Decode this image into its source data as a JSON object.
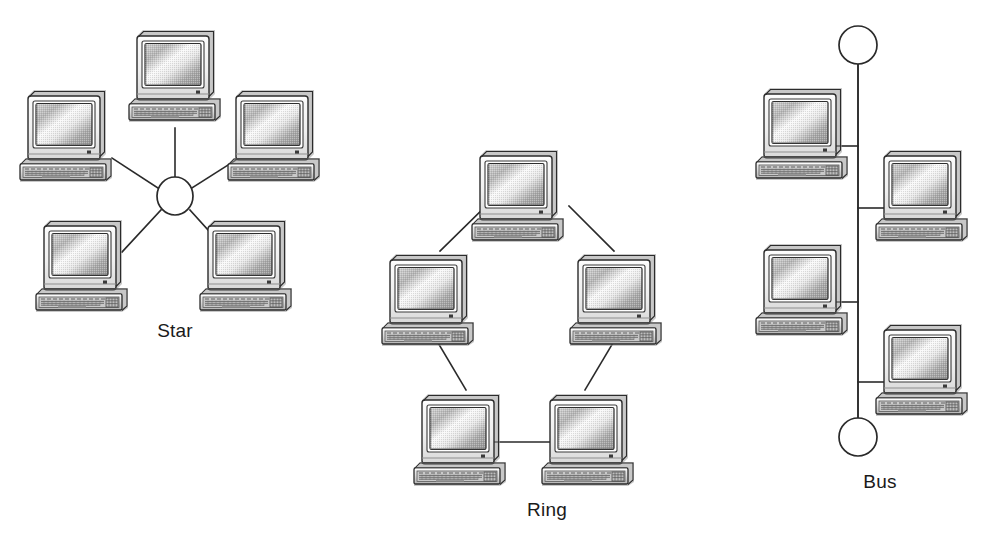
{
  "figure": {
    "background_color": "#ffffff",
    "line_color": "#2a2a2a",
    "label_color": "#1a1a1a"
  },
  "topologies": [
    {
      "id": "star",
      "label": "Star",
      "label_x": 175,
      "label_y": 337,
      "node_count": 5,
      "has_hub": true,
      "hub": {
        "cx": 175,
        "cy": 196,
        "r": 18
      },
      "computers": [
        {
          "name": "star-computer-top",
          "x": 128,
          "y": 32
        },
        {
          "name": "star-computer-upper-left",
          "x": 20,
          "y": 90
        },
        {
          "name": "star-computer-upper-right",
          "x": 228,
          "y": 90
        },
        {
          "name": "star-computer-lower-left",
          "x": 38,
          "y": 218
        },
        {
          "name": "star-computer-lower-right",
          "x": 200,
          "y": 218
        }
      ],
      "links": [
        {
          "name": "star-link-top",
          "x1": 175,
          "y1": 178,
          "x2": 175,
          "y2": 126
        },
        {
          "name": "star-link-upper-left",
          "x1": 158,
          "y1": 189,
          "x2": 110,
          "y2": 158
        },
        {
          "name": "star-link-upper-right",
          "x1": 192,
          "y1": 189,
          "x2": 240,
          "y2": 158
        },
        {
          "name": "star-link-lower-left",
          "x1": 162,
          "y1": 211,
          "x2": 120,
          "y2": 253
        },
        {
          "name": "star-link-lower-right",
          "x1": 189,
          "y1": 211,
          "x2": 228,
          "y2": 253
        }
      ]
    },
    {
      "id": "ring",
      "label": "Ring",
      "label_x": 547,
      "label_y": 516,
      "node_count": 5,
      "has_hub": false,
      "computers": [
        {
          "name": "ring-computer-top",
          "x": 470,
          "y": 148
        },
        {
          "name": "ring-computer-left",
          "x": 380,
          "y": 250
        },
        {
          "name": "ring-computer-right",
          "x": 565,
          "y": 250
        },
        {
          "name": "ring-computer-bottom-left",
          "x": 412,
          "y": 384
        },
        {
          "name": "ring-computer-bottom-right",
          "x": 540,
          "y": 384
        }
      ],
      "links": [
        {
          "name": "ring-link-top-left",
          "x1": 470,
          "y1": 210,
          "x2": 424,
          "y2": 252
        },
        {
          "name": "ring-link-top-right",
          "x1": 554,
          "y1": 210,
          "x2": 600,
          "y2": 252
        },
        {
          "name": "ring-link-left-bottom",
          "x1": 420,
          "y1": 330,
          "x2": 455,
          "y2": 388
        },
        {
          "name": "ring-link-right-bottom",
          "x1": 608,
          "y1": 330,
          "x2": 572,
          "y2": 388
        },
        {
          "name": "ring-link-bottom",
          "x1": 497,
          "y1": 441,
          "x2": 551,
          "y2": 441
        }
      ]
    },
    {
      "id": "bus",
      "label": "Bus",
      "label_x": 880,
      "label_y": 488,
      "node_count": 4,
      "has_hub": false,
      "backbone": {
        "x": 858,
        "y_top": 64,
        "y_bottom": 418
      },
      "terminators": [
        {
          "name": "bus-terminator-top",
          "cx": 858,
          "cy": 45,
          "r": 19
        },
        {
          "name": "bus-terminator-bottom",
          "cx": 858,
          "cy": 437,
          "r": 19
        }
      ],
      "computers": [
        {
          "name": "bus-computer-1",
          "x": 755,
          "y": 82,
          "side": "left",
          "stub_y": 146
        },
        {
          "name": "bus-computer-2",
          "x": 872,
          "y": 146,
          "side": "right",
          "stub_y": 210
        },
        {
          "name": "bus-computer-3",
          "x": 755,
          "y": 240,
          "side": "left",
          "stub_y": 303
        },
        {
          "name": "bus-computer-4",
          "x": 872,
          "y": 318,
          "side": "right",
          "stub_y": 382
        }
      ]
    }
  ],
  "computer_icon": {
    "name": "desktop-computer-icon",
    "width": 100,
    "height": 100,
    "monitor_fill": "#f2f2f2",
    "screen_light": "#fdfdfd",
    "screen_mid": "#b8b8b8",
    "screen_dark": "#8e8e8e",
    "bezel_fill": "#ffffff",
    "keyboard_fill": "#d6d6d6",
    "shadow_fill": "#9a9a9a",
    "outline": "#2b2b2b",
    "power_led": "#3a3a3a"
  }
}
